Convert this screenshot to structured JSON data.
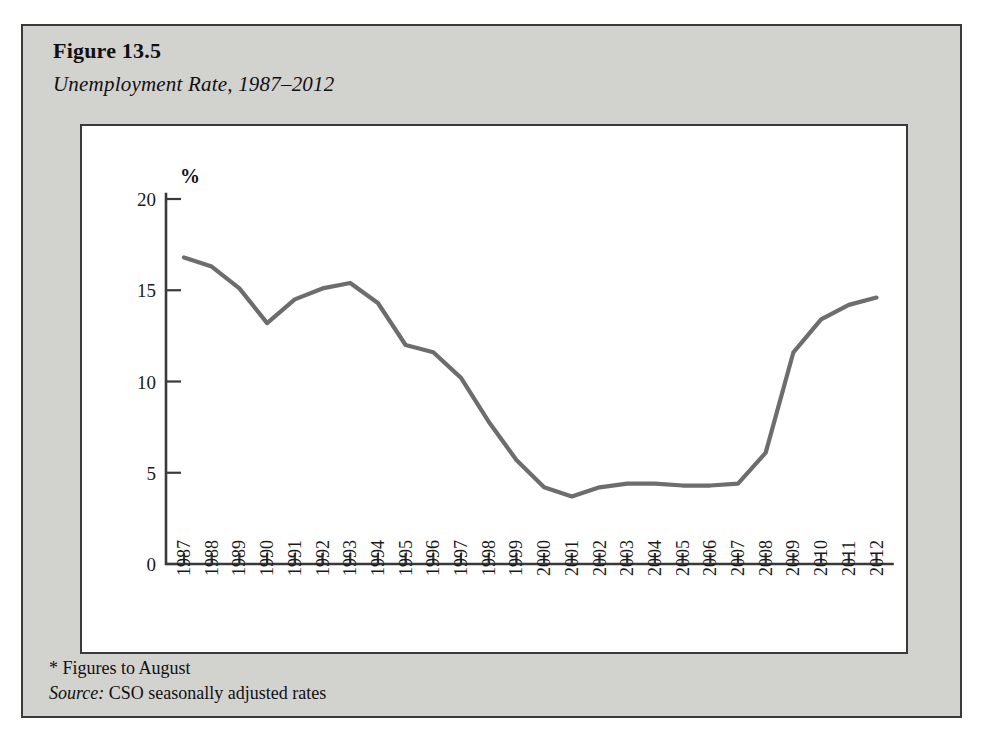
{
  "figure": {
    "number": "Figure 13.5",
    "title": "Unemployment Rate, 1987–2012",
    "note_asterisk": "* Figures to August",
    "source_label": "Source:",
    "source_text": " CSO seasonally adjusted rates"
  },
  "colors": {
    "frame_background": "#d2d2cf",
    "frame_border": "#3a3a3a",
    "panel_background": "#ffffff",
    "axis": "#3a3a3a",
    "series": "#6d6d6d",
    "text": "#101010"
  },
  "chart_data": {
    "type": "line",
    "title": "Unemployment Rate, 1987–2012",
    "xlabel": "Year",
    "ylabel": "%",
    "ylim": [
      0,
      20
    ],
    "yticks": [
      0,
      5,
      10,
      15,
      20
    ],
    "ytick_labels": [
      "0",
      "5",
      "10",
      "15",
      "20"
    ],
    "grid": false,
    "legend": false,
    "categories": [
      "1987",
      "1988",
      "1989",
      "1990",
      "1991",
      "1992",
      "1993",
      "1994",
      "1995",
      "1996",
      "1997",
      "1998",
      "1999",
      "2000",
      "2001",
      "2002",
      "2003",
      "2004",
      "2005",
      "2006",
      "2007",
      "2008",
      "2009",
      "2010",
      "2011",
      "2012"
    ],
    "series": [
      {
        "name": "Unemployment Rate",
        "color": "#6d6d6d",
        "values": [
          16.8,
          16.3,
          15.1,
          13.2,
          14.5,
          15.1,
          15.4,
          14.3,
          12.0,
          11.6,
          10.2,
          7.8,
          5.7,
          4.2,
          3.7,
          4.2,
          4.4,
          4.4,
          4.3,
          4.3,
          4.4,
          6.1,
          11.6,
          13.4,
          14.2,
          14.6
        ]
      }
    ]
  }
}
